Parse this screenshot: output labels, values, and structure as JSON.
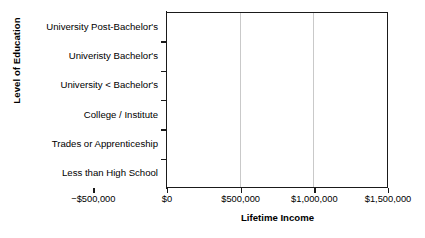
{
  "chart_data": {
    "type": "bar",
    "orientation": "horizontal",
    "title": "",
    "xlabel": "Lifetime Income",
    "ylabel": "Level of Education",
    "categories": [
      "University Post-Bachelor's",
      "Univeristy Bachelor's",
      "University < Bachelor's",
      "College / Institute",
      "Trades or Apprenticeship",
      "Less than High School"
    ],
    "values": [
      1200000,
      750000,
      405000,
      240000,
      120000,
      -237000
    ],
    "xlim": [
      -500000,
      1500000
    ],
    "xticks": [
      -500000,
      0,
      500000,
      1000000,
      1500000
    ],
    "xticklabels": [
      "−$500,000",
      "$0",
      "$500,000",
      "$1,000,000",
      "$1,500,000"
    ],
    "grid": "vertical-at-500000-and-1000000",
    "legend": "none",
    "bar_color": "#adadad",
    "axis_color": "#1a1a1a",
    "gridline_color": "#c9c9c9"
  }
}
